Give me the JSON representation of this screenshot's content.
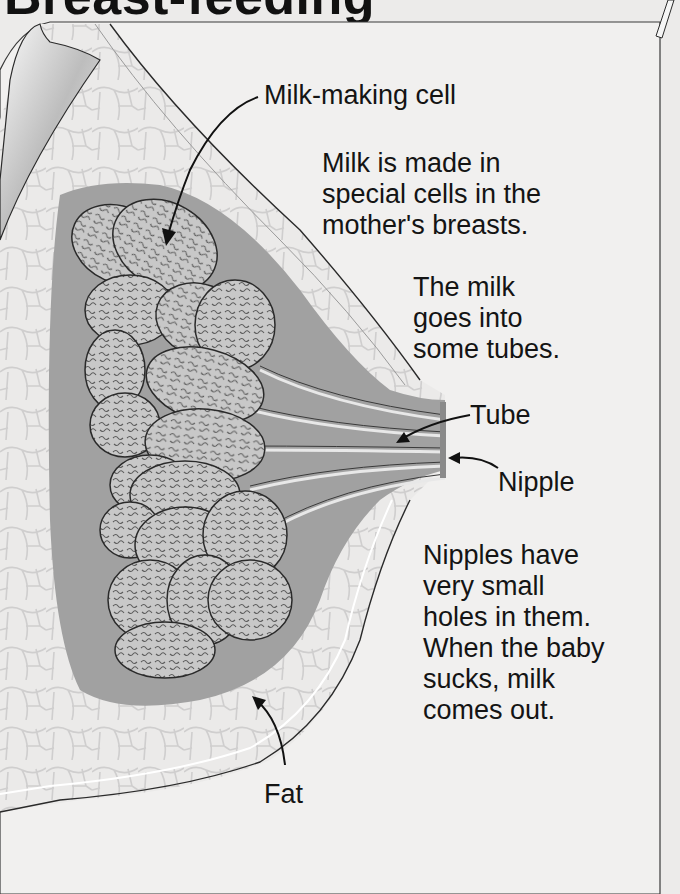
{
  "title": "Breast-feeding",
  "labels": {
    "milk_making_cell": "Milk-making cell",
    "tube": "Tube",
    "nipple": "Nipple",
    "fat": "Fat"
  },
  "paragraphs": {
    "p1": [
      "Milk is made in",
      "special cells in the",
      "mother's breasts."
    ],
    "p2": [
      "The milk",
      "goes into",
      "some tubes."
    ],
    "p3": [
      "Nipples have",
      "very small",
      "holes in them.",
      "When the baby",
      "sucks, milk",
      "comes out."
    ]
  },
  "colors": {
    "background": "#ecebea",
    "panel": "#f1f0ef",
    "skin_band": "#e2e1e0",
    "fat_cells": "#e9e8e7",
    "gland_tissue": "#9f9f9f",
    "lobules": "#c3c3c3",
    "outline": "#2a2a2a"
  }
}
